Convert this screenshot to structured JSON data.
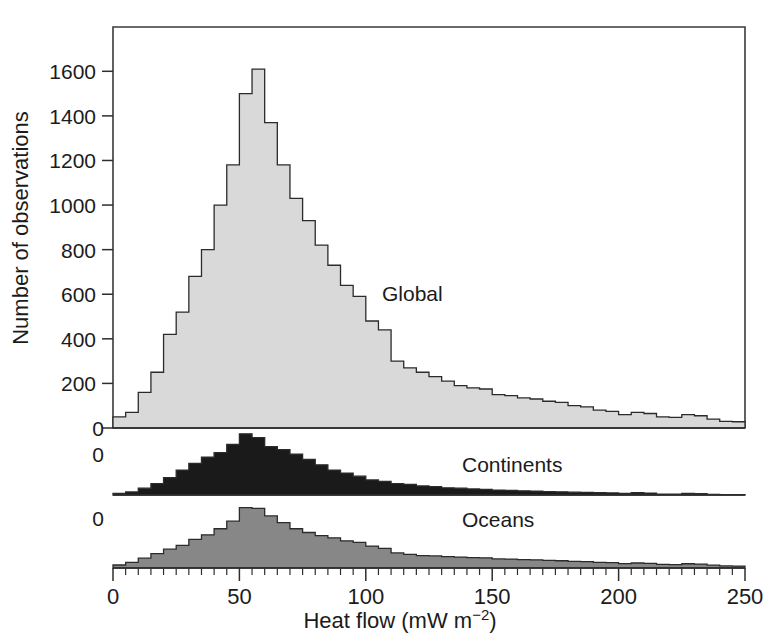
{
  "figure": {
    "title": "",
    "axis_titles": {
      "x": "Heat flow (mW m",
      "x_superscript": "−2",
      "x_close": ")",
      "x_full": "Heat flow (mW m−2)",
      "y": "Number of observations"
    },
    "colors": {
      "global_fill": "#d9d9d9",
      "continents_fill": "#1a1a1a",
      "oceans_fill": "#878787",
      "outline": "#2b2b2b",
      "axis": "#2e2e2e",
      "background": "#ffffff",
      "text": "#1b1b1b"
    },
    "panel_labels": {
      "global": "Global",
      "continents": "Continents",
      "oceans": "Oceans"
    },
    "zero_labels": {
      "global_baseline": "0",
      "continents_baseline": "0",
      "oceans_baseline": "0"
    }
  },
  "chart_data": {
    "type": "bar",
    "title": "",
    "xlabel": "Heat flow (mW m−2)",
    "ylabel": "Number of observations",
    "xlim": [
      0,
      250
    ],
    "bin_width": 5,
    "grid": false,
    "legend_position": "inline-annotation",
    "panels": [
      {
        "name": "Global",
        "label": "Global",
        "fill": "#d9d9d9",
        "ylim": [
          0,
          1700
        ],
        "yticks": [
          0,
          200,
          400,
          600,
          800,
          1000,
          1200,
          1400,
          1600
        ],
        "ytick_labels": [
          "0",
          "200",
          "400",
          "600",
          "800",
          "1000",
          "1200",
          "1400",
          "1600"
        ],
        "bin_starts": [
          0,
          5,
          10,
          15,
          20,
          25,
          30,
          35,
          40,
          45,
          50,
          55,
          60,
          65,
          70,
          75,
          80,
          85,
          90,
          95,
          100,
          105,
          110,
          115,
          120,
          125,
          130,
          135,
          140,
          145,
          150,
          155,
          160,
          165,
          170,
          175,
          180,
          185,
          190,
          195,
          200,
          205,
          210,
          215,
          220,
          225,
          230,
          235,
          240,
          245
        ],
        "values": [
          50,
          70,
          160,
          250,
          420,
          520,
          680,
          800,
          1000,
          1180,
          1500,
          1610,
          1370,
          1180,
          1030,
          930,
          820,
          730,
          640,
          590,
          480,
          440,
          300,
          270,
          250,
          230,
          210,
          190,
          180,
          175,
          150,
          145,
          135,
          130,
          120,
          115,
          100,
          95,
          80,
          75,
          60,
          70,
          65,
          50,
          48,
          60,
          55,
          40,
          30,
          28
        ]
      },
      {
        "name": "Continents",
        "label": "Continents",
        "fill": "#1a1a1a",
        "ylim": [
          0,
          900
        ],
        "yticks": [
          0
        ],
        "ytick_labels": [
          "0"
        ],
        "bin_starts": [
          0,
          5,
          10,
          15,
          20,
          25,
          30,
          35,
          40,
          45,
          50,
          55,
          60,
          65,
          70,
          75,
          80,
          85,
          90,
          95,
          100,
          105,
          110,
          115,
          120,
          125,
          130,
          135,
          140,
          145,
          150,
          155,
          160,
          165,
          170,
          175,
          180,
          185,
          190,
          195,
          200,
          205,
          210,
          215,
          220,
          225,
          230,
          235,
          240,
          245
        ],
        "values": [
          20,
          40,
          90,
          150,
          230,
          330,
          420,
          500,
          560,
          670,
          810,
          760,
          640,
          600,
          540,
          470,
          400,
          330,
          290,
          250,
          200,
          180,
          150,
          140,
          120,
          110,
          95,
          90,
          80,
          75,
          65,
          60,
          55,
          50,
          45,
          42,
          38,
          35,
          30,
          28,
          22,
          30,
          25,
          12,
          10,
          22,
          18,
          8,
          5,
          4
        ]
      },
      {
        "name": "Oceans",
        "label": "Oceans",
        "fill": "#878787",
        "ylim": [
          0,
          900
        ],
        "yticks": [
          0
        ],
        "ytick_labels": [
          "0"
        ],
        "xticks": [
          0,
          50,
          100,
          150,
          200,
          250
        ],
        "xtick_labels": [
          "0",
          "50",
          "100",
          "150",
          "200",
          "250"
        ],
        "bin_starts": [
          0,
          5,
          10,
          15,
          20,
          25,
          30,
          35,
          40,
          45,
          50,
          55,
          60,
          65,
          70,
          75,
          80,
          85,
          90,
          95,
          100,
          105,
          110,
          115,
          120,
          125,
          130,
          135,
          140,
          145,
          150,
          155,
          160,
          165,
          170,
          175,
          180,
          185,
          190,
          195,
          200,
          205,
          210,
          215,
          220,
          225,
          230,
          235,
          240,
          245
        ],
        "values": [
          40,
          75,
          130,
          190,
          250,
          300,
          380,
          440,
          520,
          620,
          800,
          790,
          690,
          600,
          520,
          470,
          430,
          400,
          360,
          340,
          290,
          260,
          200,
          180,
          165,
          160,
          150,
          145,
          138,
          135,
          120,
          118,
          112,
          108,
          100,
          96,
          88,
          84,
          74,
          70,
          58,
          66,
          62,
          48,
          45,
          56,
          52,
          38,
          28,
          26
        ]
      }
    ]
  }
}
